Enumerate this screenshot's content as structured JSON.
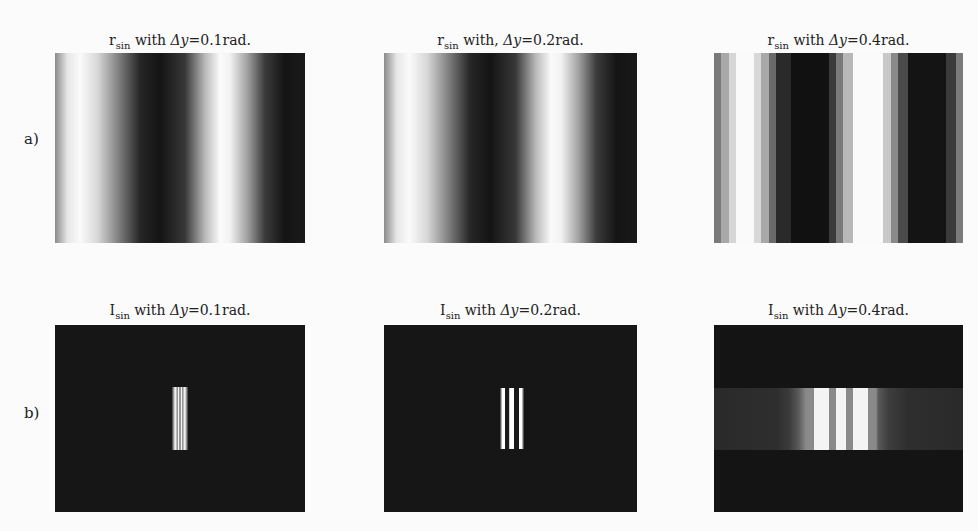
{
  "figure": {
    "rows": [
      {
        "label": "a)",
        "panels": [
          {
            "title_main": "r",
            "title_sub": "sin",
            "title_rest": " with ",
            "title_delta": "Δy",
            "title_value": "=0.1rad.",
            "type": "smooth"
          },
          {
            "title_main": "r",
            "title_sub": "sin",
            "title_rest": " with, ",
            "title_delta": "Δy",
            "title_value": "=0.2rad.",
            "type": "smooth"
          },
          {
            "title_main": "r",
            "title_sub": "sin",
            "title_rest": " with ",
            "title_delta": "Δy",
            "title_value": "=0.4rad.",
            "type": "stepped"
          }
        ]
      },
      {
        "label": "b)",
        "panels": [
          {
            "title_main": "I",
            "title_sub": "sin",
            "title_rest": " with ",
            "title_delta": "Δy",
            "title_value": "=0.1rad.",
            "type": "narrow"
          },
          {
            "title_main": "I",
            "title_sub": "sin",
            "title_rest": " with ",
            "title_delta": "Δy",
            "title_value": "=0.2rad.",
            "type": "medium"
          },
          {
            "title_main": "I",
            "title_sub": "sin",
            "title_rest": " with ",
            "title_delta": "Δy",
            "title_value": "=0.4rad.",
            "type": "wide"
          }
        ]
      }
    ]
  }
}
